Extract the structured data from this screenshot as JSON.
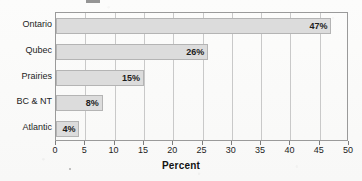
{
  "chart_data": {
    "type": "bar",
    "orientation": "horizontal",
    "title": "",
    "xlabel": "Percent",
    "ylabel": "",
    "categories": [
      "Ontario",
      "Qubec",
      "Prairies",
      "BC & NT",
      "Atlantic"
    ],
    "values": [
      47,
      26,
      15,
      8,
      4
    ],
    "data_labels": [
      "47%",
      "26%",
      "15%",
      "8%",
      "4%"
    ],
    "xlim": [
      0,
      50
    ],
    "xticks": [
      0,
      5,
      10,
      15,
      20,
      25,
      30,
      35,
      40,
      45,
      50
    ],
    "xtick_labels": [
      "0",
      "5",
      "10",
      "15",
      "20",
      "25",
      "30",
      "35",
      "40",
      "45",
      "50"
    ],
    "grid": "vertical",
    "legend": "none",
    "colors": {
      "bar_fill": "#dcdcdc",
      "bar_border": "#b4b4b4",
      "gridline": "#c9c9c9",
      "frame": "#9a9a9a",
      "text": "#1d1d1d",
      "background": "#fbfbfa"
    }
  }
}
